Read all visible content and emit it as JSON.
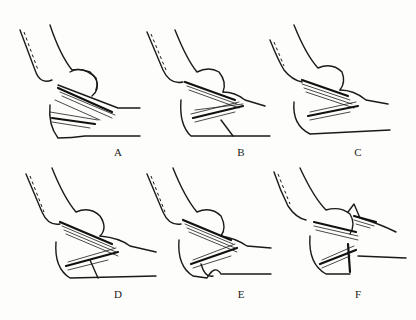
{
  "figure": {
    "panels": [
      {
        "id": "A",
        "label": "A",
        "x": 0,
        "y": 0,
        "label_x": 111,
        "label_y": 148
      },
      {
        "id": "B",
        "label": "B",
        "x": 135,
        "y": 0,
        "label_x": 99,
        "label_y": 148
      },
      {
        "id": "C",
        "label": "C",
        "x": 270,
        "y": 0,
        "label_x": 81,
        "label_y": 148
      },
      {
        "id": "D",
        "label": "D",
        "x": 0,
        "y": 160,
        "label_x": 111,
        "label_y": 130
      },
      {
        "id": "E",
        "label": "E",
        "x": 135,
        "y": 160,
        "label_x": 99,
        "label_y": 130
      },
      {
        "id": "F",
        "label": "F",
        "x": 270,
        "y": 160,
        "label_x": 81,
        "label_y": 130
      }
    ],
    "colors": {
      "ink": "#1a1a1a",
      "paper": "#fdfdfb"
    }
  }
}
